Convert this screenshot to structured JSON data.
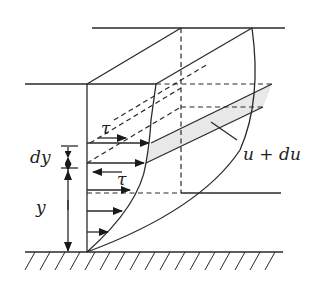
{
  "diagram": {
    "labels": {
      "tau_top": "τ",
      "tau_bottom": "τ",
      "dy": "dy",
      "y": "y",
      "u_du": "u + du"
    },
    "colors": {
      "line": "#2a2a2a",
      "shaded_layer": "#e8e8e8",
      "background": "#ffffff"
    },
    "elements": [
      "wall (hatched ground)",
      "front velocity profile curve",
      "back velocity profile curve",
      "velocity arrows (5)",
      "shear stress arrows τ (2)",
      "dimension arrows dy and y",
      "shaded fluid layer between y and y+dy",
      "dashed hidden edges"
    ]
  }
}
